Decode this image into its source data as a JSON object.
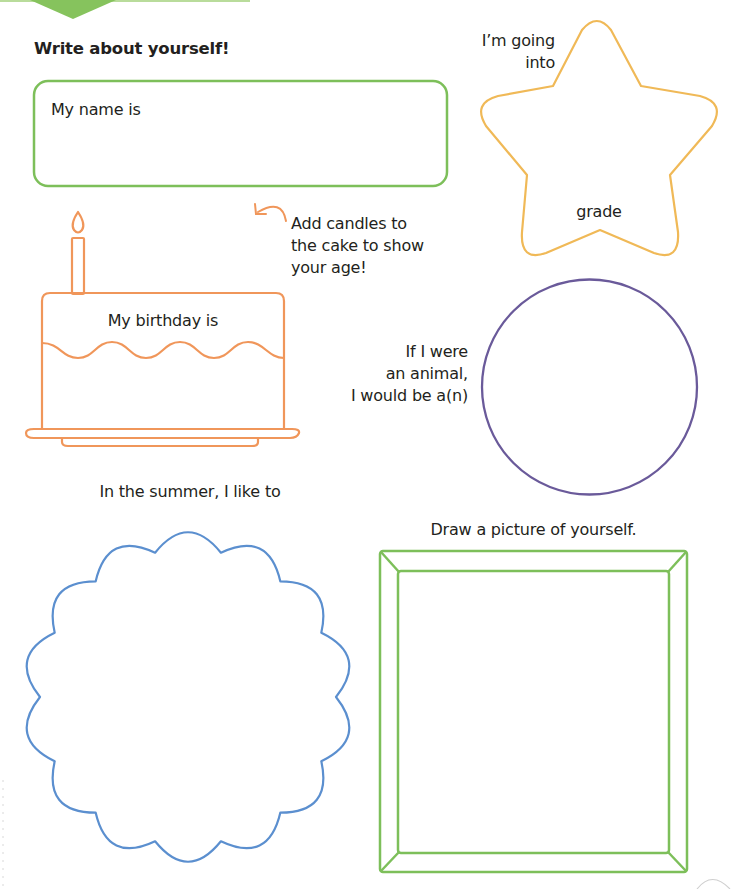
{
  "page": {
    "heading": "Write about yourself!",
    "accent_colors": {
      "green": "#7dbf5a",
      "orange": "#f0965a",
      "yellow": "#f0b957",
      "purple": "#6a5a9a",
      "blue": "#5b8fcf"
    }
  },
  "name_box": {
    "label": "My name is",
    "value": ""
  },
  "star": {
    "label_top_line1": "I’m going",
    "label_top_line2": "into",
    "label_inside": "grade",
    "value": ""
  },
  "cake": {
    "hint_line1": "Add candles to",
    "hint_line2": "the cake to show",
    "hint_line3": "your age!",
    "label": "My birthday is",
    "value": "",
    "candle_count": 1,
    "arrow_icon": "curved-arrow"
  },
  "animal": {
    "line1": "If I were",
    "line2": "an animal,",
    "line3": "I would be a(n)",
    "value": ""
  },
  "summer": {
    "label": "In the summer, I like to",
    "value": ""
  },
  "portrait": {
    "label": "Draw a picture of yourself."
  }
}
